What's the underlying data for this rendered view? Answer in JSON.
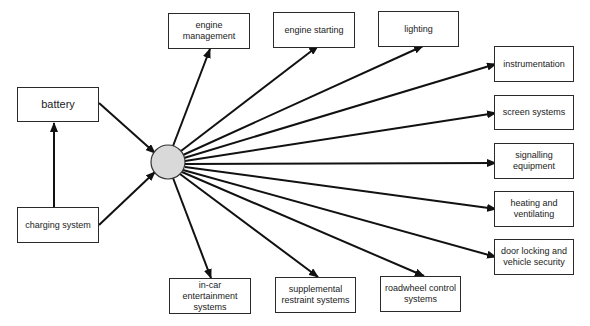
{
  "diagram": {
    "hub": {
      "name": "central-distribution-hub",
      "fill": "#d9d9d9",
      "cx": 168,
      "cy": 162,
      "r": 17
    },
    "inputs": [
      {
        "id": "battery",
        "label": "battery",
        "x": 17,
        "y": 87,
        "w": 82,
        "h": 35
      },
      {
        "id": "charging-system",
        "label": "charging system",
        "x": 17,
        "y": 207,
        "w": 82,
        "h": 36
      }
    ],
    "outputs": [
      {
        "id": "engine-management",
        "label": "engine\nmanagement",
        "x": 168,
        "y": 13,
        "w": 82,
        "h": 36
      },
      {
        "id": "engine-starting",
        "label": "engine starting",
        "x": 273,
        "y": 12,
        "w": 82,
        "h": 36
      },
      {
        "id": "lighting",
        "label": "lighting",
        "x": 378,
        "y": 11,
        "w": 81,
        "h": 36
      },
      {
        "id": "instrumentation",
        "label": "instrumentation",
        "x": 494,
        "y": 46,
        "w": 80,
        "h": 36
      },
      {
        "id": "screen-systems",
        "label": "screen systems",
        "x": 494,
        "y": 95,
        "w": 80,
        "h": 35
      },
      {
        "id": "signalling-equipment",
        "label": "signalling\nequipment",
        "x": 494,
        "y": 143,
        "w": 80,
        "h": 36
      },
      {
        "id": "heating-and-ventilating",
        "label": "heating and\nventilating",
        "x": 494,
        "y": 191,
        "w": 80,
        "h": 36
      },
      {
        "id": "door-locking-and-vehicle-security",
        "label": "door locking and\nvehicle security",
        "x": 494,
        "y": 239,
        "w": 80,
        "h": 36
      },
      {
        "id": "in-car-entertainment-systems",
        "label": "in-car entertainment\nsystems",
        "x": 169,
        "y": 278,
        "w": 82,
        "h": 36
      },
      {
        "id": "supplemental-restraint-systems",
        "label": "supplemental\nrestraint  systems",
        "x": 275,
        "y": 277,
        "w": 81,
        "h": 36
      },
      {
        "id": "roadwheel-control-systems",
        "label": "roadwheel control\nsystems",
        "x": 380,
        "y": 276,
        "w": 81,
        "h": 36
      }
    ],
    "edges": [
      {
        "from": "charging-system",
        "to": "battery",
        "x1": 54,
        "y1": 207,
        "x2": 54,
        "y2": 123
      },
      {
        "from": "battery",
        "to": "hub",
        "x1": 99,
        "y1": 103,
        "x2": 155,
        "y2": 153
      },
      {
        "from": "charging-system",
        "to": "hub",
        "x1": 99,
        "y1": 225,
        "x2": 155,
        "y2": 172
      },
      {
        "from": "hub",
        "to": "engine-management",
        "x1": 173,
        "y1": 146,
        "x2": 210,
        "y2": 49
      },
      {
        "from": "hub",
        "to": "engine-starting",
        "x1": 181,
        "y1": 151,
        "x2": 318,
        "y2": 46
      },
      {
        "from": "hub",
        "to": "lighting",
        "x1": 183,
        "y1": 155,
        "x2": 423,
        "y2": 46
      },
      {
        "from": "hub",
        "to": "instrumentation",
        "x1": 184,
        "y1": 158,
        "x2": 496,
        "y2": 64
      },
      {
        "from": "hub",
        "to": "screen-systems",
        "x1": 185,
        "y1": 161,
        "x2": 496,
        "y2": 113
      },
      {
        "from": "hub",
        "to": "signalling-equipment",
        "x1": 185,
        "y1": 164,
        "x2": 496,
        "y2": 163
      },
      {
        "from": "hub",
        "to": "heating-and-ventilating",
        "x1": 185,
        "y1": 167,
        "x2": 496,
        "y2": 209
      },
      {
        "from": "hub",
        "to": "door-locking-and-vehicle-security",
        "x1": 183,
        "y1": 170,
        "x2": 496,
        "y2": 257
      },
      {
        "from": "hub",
        "to": "in-car-entertainment-systems",
        "x1": 173,
        "y1": 178,
        "x2": 211,
        "y2": 278
      },
      {
        "from": "hub",
        "to": "supplemental-restraint-systems",
        "x1": 180,
        "y1": 174,
        "x2": 318,
        "y2": 277
      },
      {
        "from": "hub",
        "to": "roadwheel control",
        "x1": 182,
        "y1": 172,
        "x2": 424,
        "y2": 276
      }
    ],
    "colors": {
      "line": "#111111",
      "box_border": "#2a2a2a",
      "text": "#222222",
      "hub_fill": "#d9d9d9"
    }
  }
}
